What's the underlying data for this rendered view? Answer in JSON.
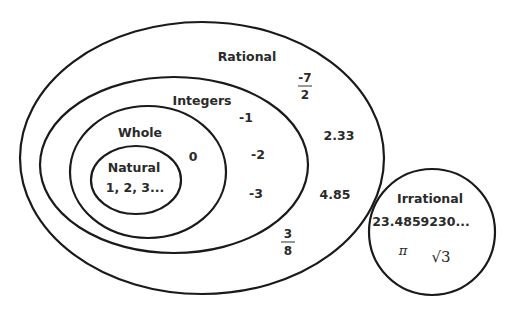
{
  "diagram": {
    "sets": {
      "rational": "Rational",
      "integers": "Integers",
      "whole": "Whole",
      "natural": "Natural",
      "irrational": "Irrational"
    },
    "natural_members": "1, 2, 3...",
    "whole_members": [
      "0"
    ],
    "integer_members": [
      "-1",
      "-2",
      "-3"
    ],
    "rational_members": {
      "frac1": {
        "num": "-7",
        "den": "2"
      },
      "dec1": "2.33",
      "dec2": "4.85",
      "frac2": {
        "num": "3",
        "den": "8"
      }
    },
    "irrational_members": {
      "dec": "23.4859230...",
      "pi": "π",
      "sqrt": "√3"
    }
  }
}
